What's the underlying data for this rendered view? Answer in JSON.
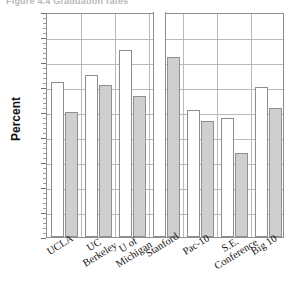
{
  "figure": {
    "caption_clipped": "Figure 4.4  Graduation rates"
  },
  "chart_data": {
    "type": "bar",
    "title": "",
    "xlabel": "",
    "ylabel": "Percent",
    "ylim": [
      0,
      90
    ],
    "ytick_step": 10,
    "yticks": [
      0,
      10,
      20,
      30,
      40,
      50,
      60,
      70,
      80,
      90
    ],
    "grid": true,
    "legend": "none",
    "categories": [
      "UCLA",
      "UC Berkeley",
      "U of Michigan",
      "Stanford",
      "Pac-10",
      "S.E. Conference",
      "Big 10"
    ],
    "category_lines": [
      [
        "UCLA",
        ""
      ],
      [
        "UC",
        "Berkeley"
      ],
      [
        "U of",
        "Michigan"
      ],
      [
        "Stanford",
        ""
      ],
      [
        "Pac-10",
        ""
      ],
      [
        "S.E.",
        "Conference"
      ],
      [
        "Big 10",
        ""
      ]
    ],
    "series": [
      {
        "name": "white",
        "fill": "#ffffff",
        "values": [
          62,
          65,
          75,
          95,
          51,
          47.5,
          60
        ],
        "clipped": [
          false,
          false,
          false,
          true,
          false,
          false,
          false
        ]
      },
      {
        "name": "grey",
        "fill": "#cfcfcf",
        "values": [
          50,
          61,
          56.5,
          72,
          46.5,
          33.5,
          51.5
        ],
        "clipped": [
          false,
          false,
          false,
          false,
          false,
          false,
          false
        ]
      }
    ]
  },
  "colors": {
    "bar_white": "#ffffff",
    "bar_grey": "#cfcfcf",
    "bar_border": "#8d8d8d",
    "grid": "#b9b9b9",
    "axis": "#8e8e8e",
    "text": "#141414"
  }
}
